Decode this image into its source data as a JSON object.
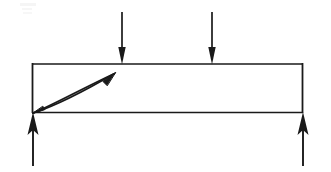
{
  "figure": {
    "title": "Simply supported beam free-body diagram",
    "canvas": {
      "width": 331,
      "height": 172,
      "background": "#ffffff"
    },
    "stroke_color": "#1a1a1a",
    "line_width": 1.6
  },
  "beam": {
    "label": "beam-outline",
    "left_x": 32,
    "right_x": 303,
    "top_y": 64,
    "bottom_y": 112,
    "caption": ""
  },
  "loads": [
    {
      "name": "point-load-1",
      "label": "",
      "x": 122,
      "tail_y": 12,
      "tip_y": 64,
      "direction": "down"
    },
    {
      "name": "point-load-2",
      "label": "",
      "x": 212,
      "tail_y": 12,
      "tip_y": 64,
      "direction": "down"
    }
  ],
  "reactions": [
    {
      "name": "support-reaction-left",
      "label": "",
      "x": 33,
      "tail_y": 166,
      "tip_y": 112,
      "direction": "up"
    },
    {
      "name": "support-reaction-right",
      "label": "",
      "x": 303,
      "tail_y": 166,
      "tip_y": 112,
      "direction": "up"
    }
  ],
  "crack": {
    "name": "diagonal-crack-sliver",
    "label": "",
    "start_x": 33,
    "start_y": 113,
    "end_x": 115,
    "end_y": 73
  },
  "annotations": {
    "faint_mark_top_left": ""
  }
}
